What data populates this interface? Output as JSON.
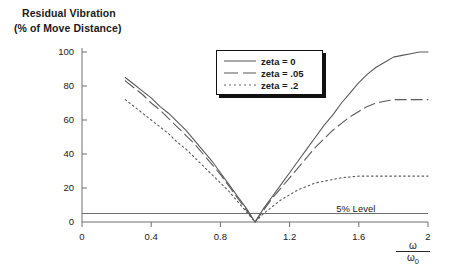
{
  "chart_data": {
    "type": "line",
    "title": "Residual Vibration (% of Move Distance)",
    "title_lines": [
      "Residual Vibration",
      "(% of Move Distance)"
    ],
    "xlabel": "ω / ω₀",
    "xlabel_numerator": "ω",
    "xlabel_denominator_base": "ω",
    "xlabel_denominator_sub": "0",
    "ylabel": "",
    "xlim": [
      0,
      2
    ],
    "ylim": [
      0,
      100
    ],
    "xticks": [
      "0",
      "0.4",
      "0.8",
      "1.2",
      "1.6",
      "2"
    ],
    "xtick_values": [
      0,
      0.4,
      0.8,
      1.2,
      1.6,
      2
    ],
    "yticks": [
      "0",
      "20",
      "40",
      "60",
      "80",
      "100"
    ],
    "ytick_values": [
      0,
      20,
      40,
      60,
      80,
      100
    ],
    "grid": false,
    "legend_position": "upper center",
    "annotations": [
      {
        "text": "5% Level",
        "x": 1.62,
        "y": 7.5
      }
    ],
    "reference_lines": [
      {
        "name": "5% level",
        "y": 5,
        "style": "solid"
      }
    ],
    "series": [
      {
        "name": "zeta = 0",
        "style": "solid",
        "x": [
          0.25,
          0.3,
          0.35,
          0.4,
          0.45,
          0.5,
          0.55,
          0.6,
          0.65,
          0.7,
          0.75,
          0.8,
          0.85,
          0.9,
          0.95,
          1.0,
          1.05,
          1.1,
          1.15,
          1.2,
          1.25,
          1.3,
          1.35,
          1.4,
          1.45,
          1.5,
          1.55,
          1.6,
          1.65,
          1.7,
          1.75,
          1.8,
          1.85,
          1.9,
          1.95,
          2.0
        ],
        "values": [
          85,
          81,
          77,
          73,
          68,
          64,
          59,
          54,
          48,
          42,
          36,
          29,
          22,
          15,
          8,
          0,
          8,
          15,
          22,
          29,
          36,
          43,
          50,
          57,
          63,
          70,
          76,
          82,
          87,
          91,
          94,
          97,
          98,
          99,
          100,
          100
        ]
      },
      {
        "name": "zeta = .05",
        "style": "dashed",
        "x": [
          0.25,
          0.3,
          0.35,
          0.4,
          0.45,
          0.5,
          0.55,
          0.6,
          0.65,
          0.7,
          0.75,
          0.8,
          0.85,
          0.9,
          0.95,
          1.0,
          1.05,
          1.1,
          1.15,
          1.2,
          1.25,
          1.3,
          1.35,
          1.4,
          1.45,
          1.5,
          1.55,
          1.6,
          1.65,
          1.7,
          1.75,
          1.8,
          1.85,
          1.9,
          1.95,
          2.0
        ],
        "values": [
          83,
          79,
          75,
          70,
          66,
          61,
          56,
          51,
          46,
          40,
          34,
          28,
          21,
          14,
          7,
          0,
          7,
          14,
          20,
          26,
          32,
          38,
          44,
          49,
          54,
          58,
          62,
          65,
          68,
          70,
          71,
          72,
          72,
          72,
          72,
          72
        ]
      },
      {
        "name": "zeta = .2",
        "style": "dotted",
        "x": [
          0.25,
          0.3,
          0.35,
          0.4,
          0.45,
          0.5,
          0.55,
          0.6,
          0.65,
          0.7,
          0.75,
          0.8,
          0.85,
          0.9,
          0.95,
          1.0,
          1.05,
          1.1,
          1.15,
          1.2,
          1.25,
          1.3,
          1.35,
          1.4,
          1.45,
          1.5,
          1.55,
          1.6,
          1.65,
          1.7,
          1.75,
          1.8,
          1.85,
          1.9,
          1.95,
          2.0
        ],
        "values": [
          72,
          68,
          64,
          60,
          56,
          52,
          47,
          43,
          38,
          33,
          28,
          23,
          18,
          12,
          6,
          0,
          5,
          9,
          13,
          16,
          19,
          21,
          23,
          24,
          25,
          26,
          26.5,
          27,
          27,
          27,
          27,
          27,
          27,
          27,
          27,
          27
        ]
      }
    ]
  },
  "legend": {
    "entries": [
      {
        "label": "zeta = 0",
        "style": "solid"
      },
      {
        "label": "zeta = .05",
        "style": "dashed"
      },
      {
        "label": "zeta = .2",
        "style": "dotted"
      }
    ]
  },
  "colors": {
    "axis": "#6e6e6e",
    "curve": "#5a5a5a",
    "text": "#1a1a1a",
    "legend_border": "#111111"
  }
}
